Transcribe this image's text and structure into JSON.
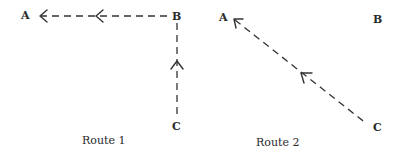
{
  "diagram": {
    "route1": {
      "caption": "Route 1",
      "points": {
        "A": "A",
        "B": "B",
        "C": "C"
      },
      "path": "C → B → A",
      "line_style": "dashed"
    },
    "route2": {
      "caption": "Route 2",
      "points": {
        "A": "A",
        "B": "B",
        "C": "C"
      },
      "path": "C → A",
      "line_style": "dashed"
    },
    "colors": {
      "line": "#333333",
      "text": "#2a2a2a",
      "background": "#ffffff"
    }
  }
}
